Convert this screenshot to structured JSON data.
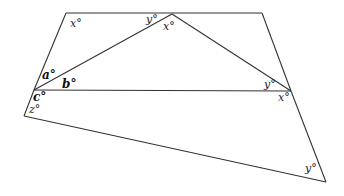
{
  "diagram": {
    "type": "geometry",
    "vertices": {
      "top_left": [
        66,
        13
      ],
      "apex": [
        172,
        14
      ],
      "top_right": [
        262,
        13
      ],
      "left_mid": [
        34,
        90
      ],
      "right_mid": [
        291,
        91
      ],
      "bottom_left": [
        24,
        116
      ],
      "bottom_right": [
        326,
        182
      ]
    },
    "labels": [
      {
        "id": "x_top_left",
        "text": "x°",
        "x": 70,
        "y": 28,
        "bold": false
      },
      {
        "id": "y_top",
        "text": "y°",
        "x": 146,
        "y": 23,
        "bold": false
      },
      {
        "id": "x_apex",
        "text": "x°",
        "x": 163,
        "y": 30,
        "bold": false
      },
      {
        "id": "a",
        "text": "a°",
        "x": 43,
        "y": 79,
        "bold": true
      },
      {
        "id": "b",
        "text": "b°",
        "x": 62,
        "y": 89,
        "bold": true
      },
      {
        "id": "c",
        "text": "c°",
        "x": 34,
        "y": 101,
        "bold": true
      },
      {
        "id": "z",
        "text": "z°",
        "x": 29,
        "y": 113,
        "bold": false
      },
      {
        "id": "y_right_mid",
        "text": "y°",
        "x": 264,
        "y": 89,
        "bold": false
      },
      {
        "id": "x_right_mid",
        "text": "x°",
        "x": 279,
        "y": 101,
        "bold": false
      },
      {
        "id": "y_bottom_right",
        "text": "y°",
        "x": 305,
        "y": 172,
        "bold": false
      }
    ]
  }
}
